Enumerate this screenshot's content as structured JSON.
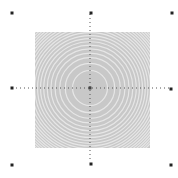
{
  "figure": {
    "background": "#ffffff",
    "square": {
      "x": 35,
      "y": 32,
      "width": 115,
      "height": 116,
      "fill": "#c8c8c8"
    },
    "rings": {
      "cx": 90,
      "cy": 88,
      "color": "#e6e6e6",
      "count": 22,
      "max_radius": 82,
      "stroke_width": 1.2
    },
    "crosshair": {
      "color": "#555555",
      "horizontal": {
        "y": 88,
        "x1": 12,
        "x2": 172
      },
      "vertical": {
        "x": 90,
        "y1": 14,
        "y2": 162
      },
      "center_marker": {
        "x": 90,
        "y": 88,
        "size": 3,
        "color": "#444444"
      }
    },
    "markers": [
      {
        "name": "corner-top-left",
        "x": 12,
        "y": 13
      },
      {
        "name": "top-center",
        "x": 91,
        "y": 13
      },
      {
        "name": "corner-top-right",
        "x": 172,
        "y": 13
      },
      {
        "name": "left-center",
        "x": 12,
        "y": 88
      },
      {
        "name": "right-center",
        "x": 171,
        "y": 89
      },
      {
        "name": "corner-bottom-left",
        "x": 12,
        "y": 165
      },
      {
        "name": "bottom-center",
        "x": 91,
        "y": 164
      },
      {
        "name": "corner-bottom-right",
        "x": 171,
        "y": 165
      }
    ],
    "marker_color": "#222222",
    "marker_size": 3
  }
}
